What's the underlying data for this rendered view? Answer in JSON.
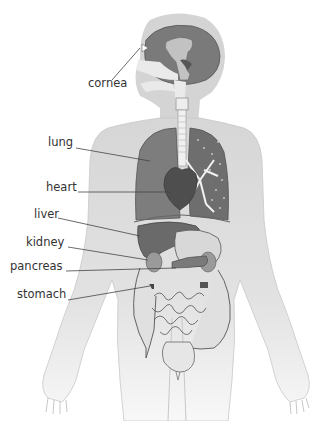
{
  "diagram": {
    "title": "",
    "labels": [
      {
        "id": "cornea",
        "text": "cornea",
        "x": 88,
        "y": 84
      },
      {
        "id": "lung",
        "text": "lung",
        "x": 48,
        "y": 141
      },
      {
        "id": "heart",
        "text": "heart",
        "x": 46,
        "y": 186
      },
      {
        "id": "liver",
        "text": "liver",
        "x": 34,
        "y": 212
      },
      {
        "id": "kidney",
        "text": "kidney",
        "x": 26,
        "y": 241
      },
      {
        "id": "pancreas",
        "text": "pancreas",
        "x": 10,
        "y": 265
      },
      {
        "id": "stomach",
        "text": "stomach",
        "x": 17,
        "y": 292
      }
    ],
    "colors": {
      "body": "#d9d9d9",
      "body_light": "#ededed",
      "organ_dark": "#6e6e6e",
      "organ_mid": "#8a8a8a",
      "organ_light": "#bdbdbd",
      "outline": "#555555",
      "leader_line": "#444444",
      "text": "#333333"
    }
  }
}
